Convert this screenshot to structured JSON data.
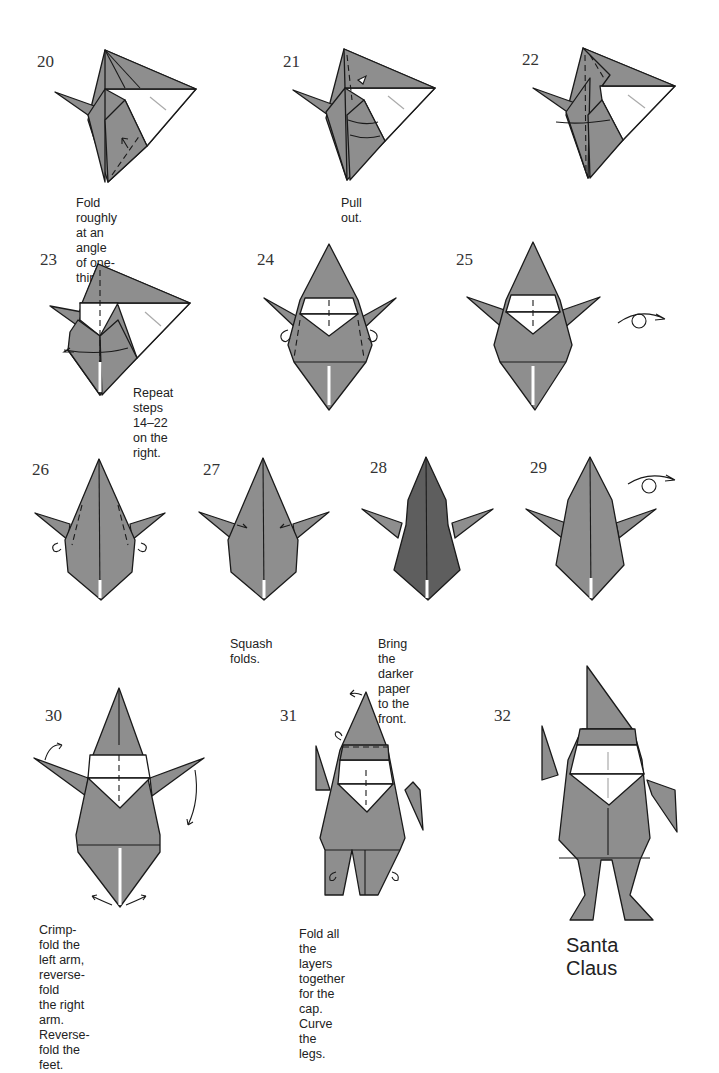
{
  "page": {
    "colors": {
      "paper_gray": "#8e8e8e",
      "paper_dark": "#5e5e5e",
      "paper_white": "#ffffff",
      "line": "#1a1a1a"
    }
  },
  "steps": [
    {
      "number": "20",
      "caption": [
        "Fold roughly at an",
        "angle of one-third."
      ]
    },
    {
      "number": "21",
      "caption": [
        "Pull out."
      ]
    },
    {
      "number": "22",
      "caption": []
    },
    {
      "number": "23",
      "caption": [
        "Repeat steps 14–22",
        "on the right."
      ]
    },
    {
      "number": "24",
      "caption": []
    },
    {
      "number": "25",
      "caption": [],
      "symbol": "turn-over-icon"
    },
    {
      "number": "26",
      "caption": []
    },
    {
      "number": "27",
      "caption": [
        "Squash folds."
      ]
    },
    {
      "number": "28",
      "caption": [
        "Bring the darker",
        "paper to the front."
      ]
    },
    {
      "number": "29",
      "caption": [],
      "symbol": "turn-over-icon"
    },
    {
      "number": "30",
      "caption": [
        "Crimp-fold the left arm, reverse-fold",
        "the right arm. Reverse-fold the feet."
      ]
    },
    {
      "number": "31",
      "caption": [
        "Fold all the layers together",
        "for the cap. Curve the legs."
      ]
    },
    {
      "number": "32",
      "caption": [],
      "result_title": "Santa Claus"
    }
  ]
}
